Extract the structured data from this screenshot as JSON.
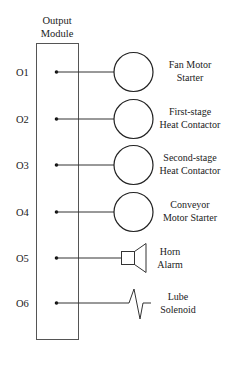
{
  "module": {
    "title_line1": "Output",
    "title_line2": "Module"
  },
  "outputs": [
    {
      "id": "O1",
      "device": "coil",
      "label_line1": "Fan Motor",
      "label_line2": "Starter"
    },
    {
      "id": "O2",
      "device": "coil",
      "label_line1": "First-stage",
      "label_line2": "Heat Contactor"
    },
    {
      "id": "O3",
      "device": "coil",
      "label_line1": "Second-stage",
      "label_line2": "Heat Contactor"
    },
    {
      "id": "O4",
      "device": "coil",
      "label_line1": "Conveyor",
      "label_line2": "Motor Starter"
    },
    {
      "id": "O5",
      "device": "horn",
      "label_line1": "Horn",
      "label_line2": "Alarm"
    },
    {
      "id": "O6",
      "device": "solenoid",
      "label_line1": "Lube",
      "label_line2": "Solenoid"
    }
  ],
  "colors": {
    "line": "#333333",
    "text": "#222222"
  }
}
